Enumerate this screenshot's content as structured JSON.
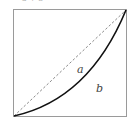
{
  "diagram": {
    "top_text": "a + b",
    "labels": {
      "a": "a",
      "b": "b"
    },
    "box": {
      "x": 13,
      "y": 9,
      "width": 114,
      "height": 108,
      "stroke": "#9a9a9a"
    },
    "diagonal": {
      "style": "dashed",
      "color": "#8a8a8a",
      "from": [
        13,
        117
      ],
      "to": [
        127,
        9
      ]
    },
    "curve": {
      "style": "solid",
      "color": "#111111",
      "from": [
        13,
        117
      ],
      "to": [
        127,
        9
      ],
      "shape": "convex (Lorenz-like)"
    }
  }
}
